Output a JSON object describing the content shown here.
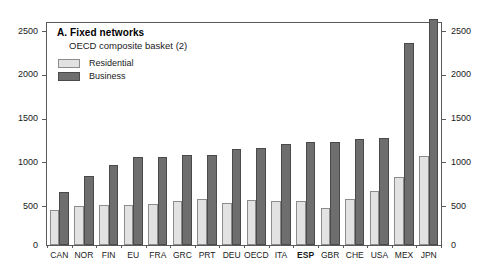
{
  "chart_data": {
    "type": "bar",
    "title": "A. Fixed networks",
    "subtitle": "OECD composite basket (2)",
    "xlabel": "",
    "ylabel": "",
    "ylim": [
      0,
      2500
    ],
    "yticks": [
      0,
      500,
      1000,
      1500,
      2000,
      2500
    ],
    "ytick_labels": [
      "0",
      "500",
      "1000",
      "1500",
      "2000",
      "2500"
    ],
    "grid": false,
    "dual_y_axis": true,
    "legend_position": "top-left",
    "highlight_category": "ESP",
    "categories": [
      "CAN",
      "NOR",
      "FIN",
      "EU",
      "FRA",
      "GRC",
      "PRT",
      "DEU",
      "OECD",
      "ITA",
      "ESP",
      "GBR",
      "CHE",
      "USA",
      "MEX",
      "JPN"
    ],
    "series": [
      {
        "name": "Residential",
        "color": "#e2e2e2",
        "values": [
          390,
          440,
          450,
          455,
          460,
          495,
          515,
          470,
          510,
          500,
          495,
          420,
          515,
          605,
          770,
          1000
        ]
      },
      {
        "name": "Business",
        "color": "#6e6e6e",
        "values": [
          600,
          780,
          900,
          990,
          995,
          1010,
          1015,
          1085,
          1095,
          1135,
          1160,
          1160,
          1190,
          1210,
          2280,
          2550
        ]
      }
    ]
  },
  "axis": {
    "left_ticks": [
      "2500",
      "2000",
      "1500",
      "1000",
      "500",
      "0"
    ],
    "right_ticks": [
      "2500",
      "2000",
      "1500",
      "1000",
      "500",
      "0"
    ]
  },
  "legend": {
    "items": [
      {
        "label": "Residential"
      },
      {
        "label": "Business"
      }
    ]
  }
}
